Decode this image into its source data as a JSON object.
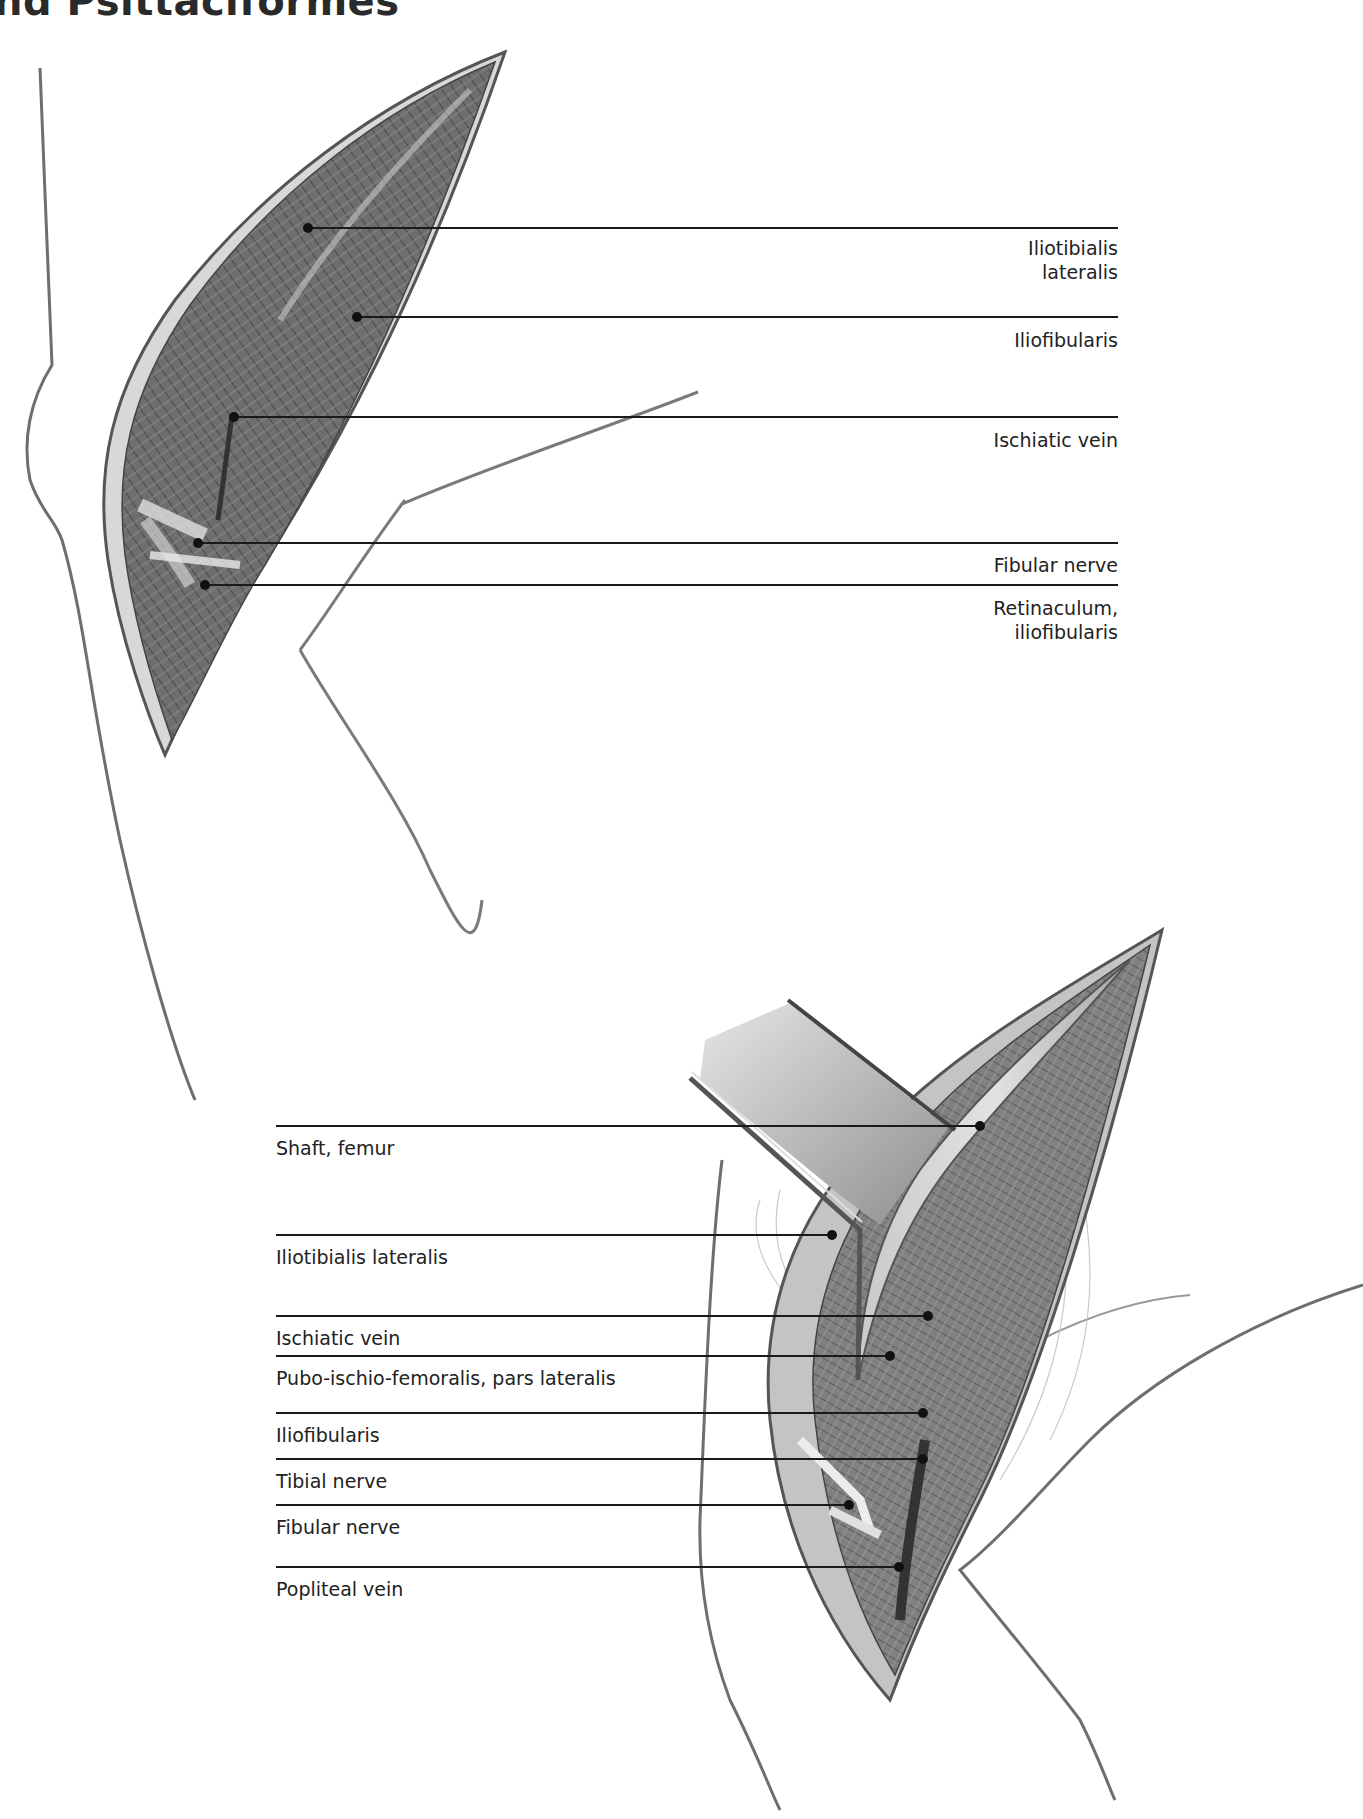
{
  "page": {
    "title": "nd Psittaciformes"
  },
  "figure_top": {
    "name": "Lateral approach to femur, superficial layer",
    "labels": [
      {
        "text": "Iliotibialis\nlateralis",
        "line1": "Iliotibialis",
        "line2": "lateralis",
        "dot": [
          308,
          228
        ],
        "line_y": 228
      },
      {
        "text": "Iliofibularis",
        "line1": "Iliofibularis",
        "dot": [
          357,
          317
        ],
        "line_y": 317
      },
      {
        "text": "Ischiatic vein",
        "line1": "Ischiatic vein",
        "dot": [
          234,
          417
        ],
        "line_y": 417
      },
      {
        "text": "Fibular nerve",
        "line1": "Fibular nerve",
        "dot": [
          198,
          543
        ],
        "line_y": 543
      },
      {
        "text": "Retinaculum,\niliofibularis",
        "line1": "Retinaculum,",
        "line2": "iliofibularis",
        "dot": [
          205,
          585
        ],
        "line_y": 585
      }
    ]
  },
  "figure_bottom": {
    "name": "Lateral approach to femur, deep layer with retracted muscle",
    "labels": [
      {
        "text": "Shaft, femur",
        "dot": [
          980,
          1126
        ],
        "line_y": 1126
      },
      {
        "text": "Iliotibialis lateralis",
        "dot": [
          832,
          1235
        ],
        "line_y": 1235
      },
      {
        "text": "Ischiatic vein",
        "dot": [
          928,
          1316
        ],
        "line_y": 1316
      },
      {
        "text": "Pubo-ischio-femoralis, pars lateralis",
        "dot": [
          890,
          1356
        ],
        "line_y": 1356
      },
      {
        "text": "Iliofibularis",
        "dot": [
          923,
          1413
        ],
        "line_y": 1413
      },
      {
        "text": "Tibial nerve",
        "dot": [
          923,
          1459
        ],
        "line_y": 1459
      },
      {
        "text": "Fibular nerve",
        "dot": [
          849,
          1505
        ],
        "line_y": 1505
      },
      {
        "text": "Popliteal vein",
        "dot": [
          899,
          1567
        ],
        "line_y": 1567
      }
    ]
  },
  "colors": {
    "leader_line": "#1a1a1a",
    "muscle_dark": "#5a5a5a",
    "muscle_mid": "#7d7d7d",
    "muscle_light": "#b5b5b5",
    "sketch_line": "#777777"
  }
}
